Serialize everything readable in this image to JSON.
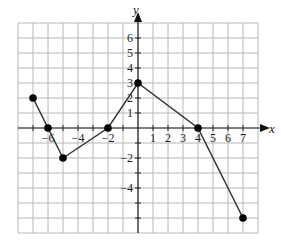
{
  "chart_data": {
    "type": "line",
    "title": "",
    "xlabel": "x",
    "ylabel": "y",
    "xlim": [
      -8,
      8
    ],
    "ylim": [
      -7,
      7
    ],
    "grid": true,
    "x_tick_labels": [
      {
        "value": -6,
        "label": "−6"
      },
      {
        "value": -4,
        "label": "−4"
      },
      {
        "value": -2,
        "label": "−2"
      },
      {
        "value": 1,
        "label": "1"
      },
      {
        "value": 2,
        "label": "2"
      },
      {
        "value": 3,
        "label": "3"
      },
      {
        "value": 4,
        "label": "4"
      },
      {
        "value": 5,
        "label": "5"
      },
      {
        "value": 6,
        "label": "6"
      },
      {
        "value": 7,
        "label": "7"
      }
    ],
    "y_tick_labels": [
      {
        "value": 6,
        "label": "6"
      },
      {
        "value": 5,
        "label": "5"
      },
      {
        "value": 4,
        "label": "4"
      },
      {
        "value": 3,
        "label": "3"
      },
      {
        "value": 2,
        "label": "2"
      },
      {
        "value": 1,
        "label": "1"
      },
      {
        "value": -2,
        "label": "−2"
      },
      {
        "value": -4,
        "label": "−4"
      }
    ],
    "series": [
      {
        "name": "piecewise",
        "x": [
          -7,
          -6,
          -5,
          -2,
          0,
          4,
          7
        ],
        "y": [
          2,
          0,
          -2,
          0,
          3,
          0,
          -6
        ]
      }
    ]
  }
}
